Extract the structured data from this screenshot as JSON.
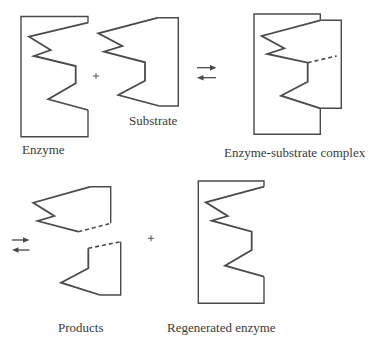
{
  "diagram": {
    "labels": {
      "enzyme": "Enzyme",
      "substrate": "Substrate",
      "complex": "Enzyme-substrate complex",
      "products": "Products",
      "regenerated": "Regenerated enzyme"
    },
    "operators": {
      "plus_top": "+",
      "plus_bottom": "+",
      "equilibrium_top": "⇄",
      "equilibrium_bottom": "⇄"
    },
    "colors": {
      "line": "#4a4a4a",
      "text": "#3a3a3a",
      "background": "#ffffff"
    },
    "steps": [
      {
        "from": [
          "Enzyme",
          "Substrate"
        ],
        "to": "Enzyme-substrate complex",
        "reversible": true
      },
      {
        "from": "Enzyme-substrate complex",
        "to": [
          "Products",
          "Regenerated enzyme"
        ],
        "reversible": true
      }
    ]
  }
}
